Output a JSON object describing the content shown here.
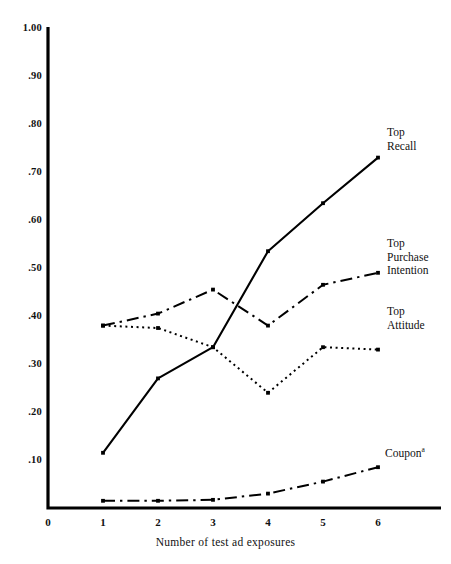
{
  "chart_data": {
    "type": "line",
    "title": "",
    "xlabel": "Number of test ad exposures",
    "ylabel": "",
    "x": [
      1,
      2,
      3,
      4,
      5,
      6
    ],
    "xlim": [
      0,
      6
    ],
    "ylim": [
      0,
      1.0
    ],
    "grid": false,
    "legend_position": "inline-right-of-series",
    "xticks": [
      "0",
      "1",
      "2",
      "3",
      "4",
      "5",
      "6"
    ],
    "yticks": [
      "1.00",
      ".90",
      ".80",
      ".70",
      ".60",
      ".50",
      ".40",
      ".30",
      ".20",
      ".10"
    ],
    "ytick_values": [
      1.0,
      0.9,
      0.8,
      0.7,
      0.6,
      0.5,
      0.4,
      0.3,
      0.2,
      0.1
    ],
    "series": [
      {
        "name": "Top Recall",
        "label_lines": [
          "Top",
          "Recall"
        ],
        "linestyle": "solid",
        "color": "#000000",
        "values": [
          0.115,
          0.27,
          0.335,
          0.535,
          0.635,
          0.73
        ]
      },
      {
        "name": "Top Purchase Intention",
        "label_lines": [
          "Top",
          "Purchase",
          "Intention"
        ],
        "linestyle": "dash-dot",
        "color": "#000000",
        "values": [
          0.38,
          0.405,
          0.455,
          0.38,
          0.465,
          0.49
        ]
      },
      {
        "name": "Top Attitude",
        "label_lines": [
          "Top",
          "Attitude"
        ],
        "linestyle": "dotted",
        "color": "#000000",
        "values": [
          0.38,
          0.375,
          0.335,
          0.24,
          0.335,
          0.33
        ]
      },
      {
        "name": "Coupon",
        "label_lines": [
          "Coupon"
        ],
        "label_superscript": "a",
        "linestyle": "dash-dot",
        "color": "#000000",
        "values": [
          0.015,
          0.015,
          0.017,
          0.03,
          0.055,
          0.085
        ]
      }
    ],
    "axis_color": "#000000"
  }
}
